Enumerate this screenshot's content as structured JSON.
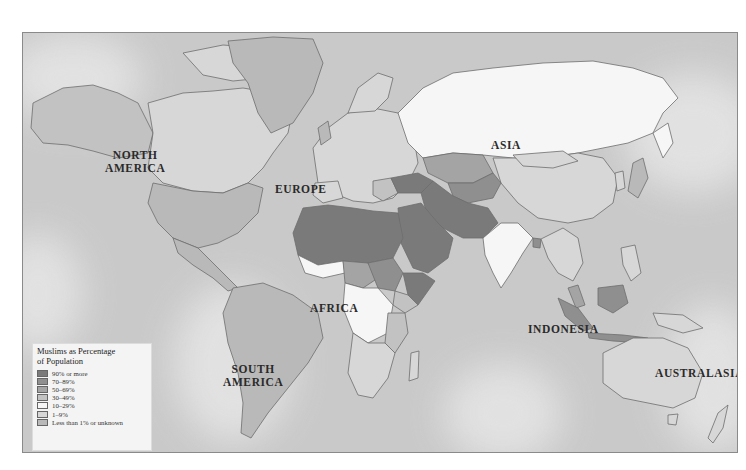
{
  "map": {
    "title": "Muslims as Percentage of Population",
    "legend": {
      "title_line1": "Muslims as Percentage",
      "title_line2": "of Population",
      "categories": [
        {
          "label": "90% or more",
          "color": "#7a7a7a"
        },
        {
          "label": "70–89%",
          "color": "#8f8f8f"
        },
        {
          "label": "50–69%",
          "color": "#a4a4a4"
        },
        {
          "label": "30–49%",
          "color": "#c2c2c2"
        },
        {
          "label": "10–29%",
          "color": "#f6f6f6"
        },
        {
          "label": "1–9%",
          "color": "#d7d7d7"
        },
        {
          "label": "Less than 1% or unknown",
          "color": "#b9b9b9"
        }
      ]
    },
    "region_labels": {
      "north_america_1": "NORTH",
      "north_america_2": "AMERICA",
      "europe": "EUROPE",
      "asia": "ASIA",
      "africa": "AFRICA",
      "south_america_1": "SOUTH",
      "south_america_2": "AMERICA",
      "indonesia": "INDONESIA",
      "australasia": "AUSTRALASIA"
    },
    "colors": {
      "ocean": "#c9c9c9",
      "ocean_glow": "#e6e6e6",
      "border": "#6d6d6d"
    }
  }
}
